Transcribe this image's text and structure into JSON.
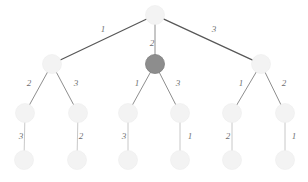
{
  "figure": {
    "kind": "tree-diagram",
    "background_color": "#ffffff",
    "width": 308,
    "height": 182
  },
  "style": {
    "node_fill_light": "#f3f3f3",
    "node_fill_highlight": "#8d8d8d",
    "node_stroke_light": "#ededed",
    "node_stroke_highlight": "#7e7e7e",
    "edge_color_dark": "#575757",
    "edge_color_mid": "#8e8e8e",
    "edge_color_light": "#c2c2c2",
    "label_color": "#6f6f6f"
  },
  "nodes": [
    {
      "id": "root",
      "name": "node-root",
      "cx": 155,
      "cy": 15,
      "r": 9.5,
      "state": "normal"
    },
    {
      "id": "l1a",
      "name": "node-level1-left",
      "cx": 52,
      "cy": 64,
      "r": 9.5,
      "state": "normal"
    },
    {
      "id": "l1b",
      "name": "node-level1-middle",
      "cx": 155,
      "cy": 64,
      "r": 9.5,
      "state": "highlight"
    },
    {
      "id": "l1c",
      "name": "node-level1-right",
      "cx": 261,
      "cy": 64,
      "r": 9.5,
      "state": "normal"
    },
    {
      "id": "l2a",
      "name": "node-level2-1",
      "cx": 25,
      "cy": 113,
      "r": 9.5,
      "state": "normal"
    },
    {
      "id": "l2b",
      "name": "node-level2-2",
      "cx": 78,
      "cy": 113,
      "r": 9.5,
      "state": "normal"
    },
    {
      "id": "l2c",
      "name": "node-level2-3",
      "cx": 128,
      "cy": 113,
      "r": 9.5,
      "state": "normal"
    },
    {
      "id": "l2d",
      "name": "node-level2-4",
      "cx": 180,
      "cy": 113,
      "r": 9.5,
      "state": "normal"
    },
    {
      "id": "l2e",
      "name": "node-level2-5",
      "cx": 232,
      "cy": 113,
      "r": 9.5,
      "state": "normal"
    },
    {
      "id": "l2f",
      "name": "node-level2-6",
      "cx": 285,
      "cy": 113,
      "r": 9.5,
      "state": "normal"
    },
    {
      "id": "l3a",
      "name": "node-level3-1",
      "cx": 24,
      "cy": 160,
      "r": 9.5,
      "state": "normal"
    },
    {
      "id": "l3b",
      "name": "node-level3-2",
      "cx": 77,
      "cy": 160,
      "r": 9.5,
      "state": "normal"
    },
    {
      "id": "l3c",
      "name": "node-level3-3",
      "cx": 128,
      "cy": 160,
      "r": 9.5,
      "state": "normal"
    },
    {
      "id": "l3d",
      "name": "node-level3-4",
      "cx": 180,
      "cy": 160,
      "r": 9.5,
      "state": "normal"
    },
    {
      "id": "l3e",
      "name": "node-level3-5",
      "cx": 232,
      "cy": 160,
      "r": 9.5,
      "state": "normal"
    },
    {
      "id": "l3f",
      "name": "node-level3-6",
      "cx": 285,
      "cy": 160,
      "r": 9.5,
      "state": "normal"
    }
  ],
  "edges": [
    {
      "name": "edge-root-left",
      "from": "root",
      "to": "l1a",
      "weight": "1",
      "label_x": 103,
      "label_y": 29,
      "tone": "dark"
    },
    {
      "name": "edge-root-middle",
      "from": "root",
      "to": "l1b",
      "weight": "2",
      "label_x": 152,
      "label_y": 43,
      "tone": "mid"
    },
    {
      "name": "edge-root-right",
      "from": "root",
      "to": "l1c",
      "weight": "3",
      "label_x": 214,
      "label_y": 29,
      "tone": "dark"
    },
    {
      "name": "edge-l1a-l2a",
      "from": "l1a",
      "to": "l2a",
      "weight": "2",
      "label_x": 29,
      "label_y": 83,
      "tone": "mid"
    },
    {
      "name": "edge-l1a-l2b",
      "from": "l1a",
      "to": "l2b",
      "weight": "3",
      "label_x": 76,
      "label_y": 83,
      "tone": "mid"
    },
    {
      "name": "edge-l1b-l2c",
      "from": "l1b",
      "to": "l2c",
      "weight": "1",
      "label_x": 137,
      "label_y": 83,
      "tone": "mid"
    },
    {
      "name": "edge-l1b-l2d",
      "from": "l1b",
      "to": "l2d",
      "weight": "3",
      "label_x": 178,
      "label_y": 83,
      "tone": "mid"
    },
    {
      "name": "edge-l1c-l2e",
      "from": "l1c",
      "to": "l2e",
      "weight": "1",
      "label_x": 241,
      "label_y": 83,
      "tone": "mid"
    },
    {
      "name": "edge-l1c-l2f",
      "from": "l1c",
      "to": "l2f",
      "weight": "2",
      "label_x": 284,
      "label_y": 83,
      "tone": "mid"
    },
    {
      "name": "edge-l2a-l3a",
      "from": "l2a",
      "to": "l3a",
      "weight": "3",
      "label_x": 21,
      "label_y": 136,
      "tone": "light"
    },
    {
      "name": "edge-l2b-l3b",
      "from": "l2b",
      "to": "l3b",
      "weight": "2",
      "label_x": 81,
      "label_y": 136,
      "tone": "light"
    },
    {
      "name": "edge-l2c-l3c",
      "from": "l2c",
      "to": "l3c",
      "weight": "3",
      "label_x": 124,
      "label_y": 136,
      "tone": "light"
    },
    {
      "name": "edge-l2d-l3d",
      "from": "l2d",
      "to": "l3d",
      "weight": "1",
      "label_x": 190,
      "label_y": 136,
      "tone": "light"
    },
    {
      "name": "edge-l2e-l3e",
      "from": "l2e",
      "to": "l3e",
      "weight": "2",
      "label_x": 228,
      "label_y": 136,
      "tone": "light"
    },
    {
      "name": "edge-l2f-l3f",
      "from": "l2f",
      "to": "l3f",
      "weight": "1",
      "label_x": 294,
      "label_y": 136,
      "tone": "light"
    }
  ]
}
